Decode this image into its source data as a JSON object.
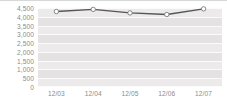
{
  "chart_data": {
    "type": "line",
    "title": "",
    "subtitle": "",
    "xlabel": "",
    "ylabel": "",
    "categories": [
      "12/03",
      "12/04",
      "12/05",
      "12/06",
      "12/07"
    ],
    "series": [
      {
        "name": "",
        "values": [
          4300,
          4420,
          4220,
          4130,
          4450
        ]
      }
    ],
    "ylim": [
      0,
      4500
    ],
    "y_ticks": [
      0,
      500,
      1000,
      1500,
      2000,
      2500,
      3000,
      3500,
      4000,
      4500
    ],
    "y_tick_labels": [
      "0",
      "500",
      "1,000",
      "1,500",
      "2,000",
      "2,500",
      "3,000",
      "3,500",
      "4,000",
      "4,500"
    ],
    "grid": true,
    "legend": false,
    "legend_position": "none",
    "colors": {
      "line": "#555555",
      "marker_fill": "#ffffff",
      "marker_stroke": "#7a7a7a",
      "plot_background": "#eceaea",
      "band": "#e4e2e2",
      "gridline": "#fbfbfb",
      "axis_text": "#8b8b8b",
      "top_rule": "#d8d8d8"
    }
  }
}
